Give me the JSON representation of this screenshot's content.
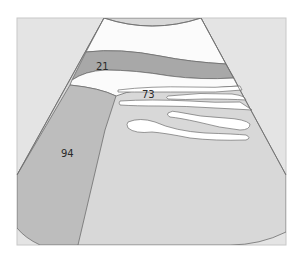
{
  "diagram": {
    "type": "ultrasound-sector-schematic",
    "labels": [
      {
        "id": "region-21",
        "text": "21",
        "x": 102,
        "y": 70
      },
      {
        "id": "region-73",
        "text": "73",
        "x": 148,
        "y": 98
      },
      {
        "id": "region-94",
        "text": "94",
        "x": 67,
        "y": 157
      }
    ],
    "colors": {
      "frame_background": "#e4e4e4",
      "frame_border": "#bdbdbd",
      "near_field": "#fbfbfb",
      "dark_band": "#a8a8a8",
      "medium_region": "#bdbdbd",
      "light_region": "#d8d8d8",
      "white_streak": "#ffffff",
      "outline": "#6e6e6e"
    }
  }
}
